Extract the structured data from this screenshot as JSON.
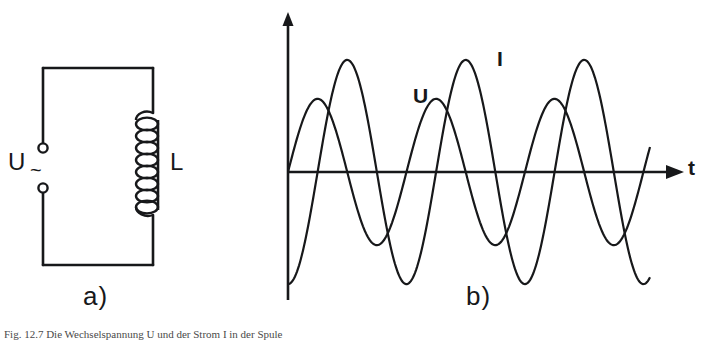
{
  "figure": {
    "panel_a_label": "a)",
    "panel_b_label": "b)",
    "caption": "Fig. 12.7 Die Wechselspannung U und der Strom I in der Spule"
  },
  "circuit": {
    "source_label": "U",
    "source_symbol": "~",
    "inductor_label": "L",
    "terminal_count": 2,
    "coil_turns": 8,
    "line_color": "#17181a"
  },
  "chart_data": {
    "type": "line",
    "title": "",
    "xlabel": "t",
    "ylabel": "",
    "grid": false,
    "legend": "inline-annotations",
    "axis": {
      "x_axis_label": "t",
      "y_axis_label": "",
      "origin_px": [
        288,
        172
      ],
      "x_arrow_tip_px": [
        684,
        172
      ],
      "y_arrow_tip_px": [
        288,
        14
      ],
      "xlim": [
        0,
        6.6
      ],
      "ylim": [
        -1.15,
        1.15
      ]
    },
    "series": [
      {
        "name": "U",
        "label": "U",
        "label_pos_px": [
          413,
          85
        ],
        "amplitude": 0.62,
        "period": 2.16,
        "phase_deg": 0,
        "waveform": "sine",
        "color": "#17181a"
      },
      {
        "name": "I",
        "label": "I",
        "label_pos_px": [
          497,
          48
        ],
        "amplitude": 0.95,
        "period": 2.16,
        "phase_deg": -90,
        "waveform": "cosine-lagging",
        "color": "#17181a"
      }
    ],
    "annotations": [
      {
        "text": "U",
        "x_px": 413,
        "y_px": 85
      },
      {
        "text": "I",
        "x_px": 497,
        "y_px": 48
      },
      {
        "text": "t",
        "x_px": 688,
        "y_px": 157
      }
    ]
  }
}
